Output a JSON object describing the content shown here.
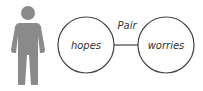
{
  "diagram": {
    "person_icon": "person-icon",
    "connector_label": "Pair",
    "nodes": [
      {
        "label": "hopes"
      },
      {
        "label": "worries"
      }
    ]
  },
  "colors": {
    "person": "#8a8a8a",
    "stroke": "#444444",
    "text": "#333333"
  }
}
